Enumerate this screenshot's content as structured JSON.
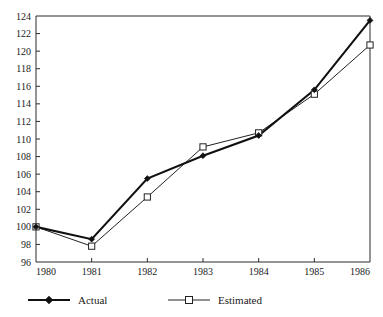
{
  "chart_data": {
    "type": "line",
    "title": "",
    "subtitle": "",
    "xlabel": "",
    "ylabel": "",
    "x": [
      1980,
      1981,
      1982,
      1983,
      1984,
      1985,
      1986
    ],
    "xtick_labels": [
      "1980",
      "1981",
      "1982",
      "1983",
      "1984",
      "1985",
      "1986"
    ],
    "ytick_labels": [
      "96",
      "98",
      "100",
      "102",
      "104",
      "106",
      "108",
      "110",
      "112",
      "114",
      "116",
      "118",
      "120",
      "122",
      "124"
    ],
    "ytick_values": [
      96,
      98,
      100,
      102,
      104,
      106,
      108,
      110,
      112,
      114,
      116,
      118,
      120,
      122,
      124
    ],
    "xlim": [
      1980,
      1986
    ],
    "ylim": [
      96,
      124
    ],
    "grid": false,
    "legend_position": "below",
    "series": [
      {
        "name": "Actual",
        "values": [
          100.0,
          98.6,
          105.5,
          108.1,
          110.4,
          115.6,
          123.5
        ],
        "marker": "filled-diamond",
        "line_style": "thick-solid",
        "color": "#111111"
      },
      {
        "name": "Estimated",
        "values": [
          100.0,
          97.8,
          103.4,
          109.1,
          110.7,
          115.1,
          120.7
        ],
        "marker": "hollow-square",
        "line_style": "thin-solid",
        "color": "#222222"
      }
    ]
  },
  "legend": {
    "items": [
      {
        "label": "Actual",
        "marker": "filled-diamond"
      },
      {
        "label": "Estimated",
        "marker": "hollow-square"
      }
    ]
  }
}
